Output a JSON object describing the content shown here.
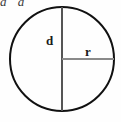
{
  "figure": {
    "type": "geometry-diagram",
    "shape": "circle",
    "background_color": "#fefefe",
    "circle": {
      "stroke_color": "#111111",
      "stroke_width": 2,
      "center_x": 62,
      "center_y": 59,
      "radius": 52,
      "fill": "none"
    },
    "segments": [
      {
        "name": "diameter",
        "label": "d",
        "orientation": "vertical",
        "color": "#555555",
        "stroke_width": 2,
        "x1": 62,
        "y1": 7,
        "x2": 62,
        "y2": 111
      },
      {
        "name": "radius",
        "label": "r",
        "orientation": "horizontal",
        "color": "#8a8a8a",
        "stroke_width": 2,
        "x1": 62,
        "y1": 59,
        "x2": 114,
        "y2": 59
      }
    ],
    "labels": {
      "diameter_label": "d",
      "radius_label": "r"
    },
    "clipped_text": {
      "content": "d d",
      "note": "partially cut off at top edge of image"
    }
  }
}
